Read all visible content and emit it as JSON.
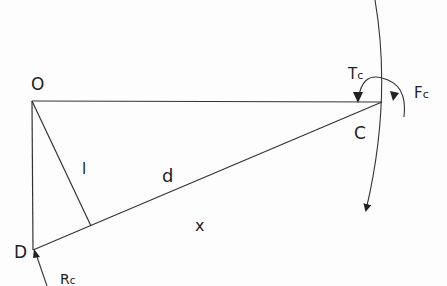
{
  "diagram": {
    "labels": {
      "O": "O",
      "C": "C",
      "D": "D",
      "l": "l",
      "d": "d",
      "x": "x",
      "Tc_main": "T",
      "Tc_sub": "c",
      "Fc_main": "F",
      "Fc_sub": "c",
      "Rc_main": "R",
      "Rc_sub": "c"
    },
    "points": {
      "O": [
        32,
        101
      ],
      "C": [
        382,
        102
      ],
      "D": [
        33,
        250
      ],
      "foot": [
        91,
        226
      ]
    },
    "colors": {
      "line": "#333333",
      "text": "#222222"
    }
  }
}
